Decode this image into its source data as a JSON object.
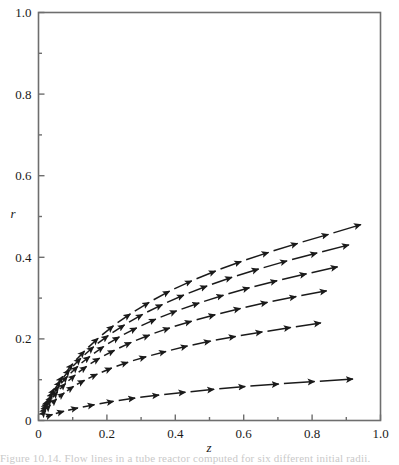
{
  "figure": {
    "background_color": "#ffffff",
    "frame_color": "#6e6e6e",
    "ink_color": "#1a1a1a",
    "caption_fragment": "Figure 10.14.  Flow lines in a tube reactor computed for six different initial radii."
  },
  "axes": {
    "x_title": "z",
    "y_title": "r",
    "x_tick_labels": [
      "0",
      "0.2",
      "0.4",
      "0.6",
      "0.8",
      "1.0"
    ],
    "y_tick_labels": [
      "0",
      "0.2",
      "0.4",
      "0.6",
      "0.8",
      "1.0"
    ],
    "x_tick_values": [
      0,
      0.2,
      0.4,
      0.6,
      0.8,
      1.0
    ],
    "y_tick_values": [
      0,
      0.2,
      0.4,
      0.6,
      0.8,
      1.0
    ],
    "x_minor_values": [
      0.1,
      0.3,
      0.5,
      0.7,
      0.9
    ],
    "y_minor_values": [
      0.1,
      0.3,
      0.5,
      0.7,
      0.9
    ]
  },
  "chart_data": {
    "type": "line",
    "title": "",
    "subtitle": "",
    "xlabel": "z",
    "ylabel": "r",
    "xlim": [
      0.0,
      1.0
    ],
    "ylim": [
      0.0,
      1.0
    ],
    "grid": false,
    "legend": "none",
    "marker": "arrowhead-chain",
    "line_style": "dashed-with-arrowheads",
    "annotations": [],
    "series": [
      {
        "name": "streamline-1",
        "x": [
          0.015,
          0.03,
          0.05,
          0.075,
          0.105,
          0.14,
          0.18,
          0.225,
          0.275,
          0.33,
          0.39,
          0.455,
          0.525,
          0.6,
          0.68,
          0.765,
          0.855,
          0.95
        ],
        "y": [
          0.03,
          0.055,
          0.083,
          0.113,
          0.144,
          0.175,
          0.206,
          0.236,
          0.265,
          0.293,
          0.32,
          0.345,
          0.369,
          0.392,
          0.414,
          0.436,
          0.458,
          0.482
        ]
      },
      {
        "name": "streamline-2",
        "x": [
          0.013,
          0.027,
          0.045,
          0.068,
          0.096,
          0.129,
          0.167,
          0.21,
          0.258,
          0.311,
          0.369,
          0.432,
          0.5,
          0.573,
          0.651,
          0.734,
          0.822,
          0.915
        ],
        "y": [
          0.026,
          0.049,
          0.074,
          0.101,
          0.129,
          0.157,
          0.185,
          0.212,
          0.238,
          0.263,
          0.287,
          0.31,
          0.332,
          0.353,
          0.373,
          0.393,
          0.412,
          0.432
        ]
      },
      {
        "name": "streamline-3",
        "x": [
          0.012,
          0.025,
          0.042,
          0.063,
          0.089,
          0.12,
          0.156,
          0.197,
          0.243,
          0.294,
          0.35,
          0.411,
          0.477,
          0.548,
          0.624,
          0.705,
          0.791,
          0.882
        ],
        "y": [
          0.022,
          0.042,
          0.064,
          0.088,
          0.112,
          0.137,
          0.161,
          0.185,
          0.208,
          0.23,
          0.251,
          0.271,
          0.29,
          0.309,
          0.327,
          0.344,
          0.361,
          0.378
        ]
      },
      {
        "name": "streamline-4",
        "x": [
          0.011,
          0.023,
          0.039,
          0.059,
          0.083,
          0.112,
          0.146,
          0.185,
          0.229,
          0.278,
          0.332,
          0.391,
          0.455,
          0.524,
          0.598,
          0.677,
          0.761,
          0.85
        ],
        "y": [
          0.018,
          0.035,
          0.054,
          0.074,
          0.094,
          0.115,
          0.136,
          0.156,
          0.175,
          0.194,
          0.212,
          0.229,
          0.245,
          0.261,
          0.276,
          0.291,
          0.305,
          0.319
        ]
      },
      {
        "name": "streamline-5",
        "x": [
          0.01,
          0.022,
          0.037,
          0.056,
          0.079,
          0.107,
          0.14,
          0.178,
          0.221,
          0.269,
          0.322,
          0.38,
          0.443,
          0.511,
          0.584,
          0.662,
          0.745,
          0.833
        ],
        "y": [
          0.013,
          0.026,
          0.04,
          0.055,
          0.07,
          0.086,
          0.101,
          0.116,
          0.131,
          0.145,
          0.158,
          0.171,
          0.184,
          0.196,
          0.207,
          0.218,
          0.229,
          0.24
        ]
      },
      {
        "name": "streamline-6",
        "x": [
          0.018,
          0.045,
          0.08,
          0.122,
          0.171,
          0.227,
          0.29,
          0.36,
          0.437,
          0.521,
          0.612,
          0.71,
          0.815,
          0.927
        ],
        "y": [
          0.008,
          0.016,
          0.024,
          0.032,
          0.04,
          0.048,
          0.056,
          0.063,
          0.07,
          0.077,
          0.084,
          0.09,
          0.096,
          0.102
        ]
      }
    ]
  }
}
